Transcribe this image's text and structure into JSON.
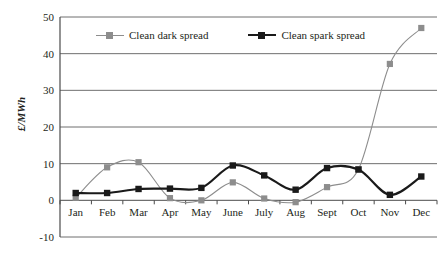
{
  "chart_data": {
    "type": "line",
    "title": "",
    "subtitle": "",
    "xlabel": "",
    "ylabel": "£/MWh",
    "categories": [
      "Jan",
      "Feb",
      "Mar",
      "Apr",
      "May",
      "June",
      "July",
      "Aug",
      "Sept",
      "Oct",
      "Nov",
      "Dec"
    ],
    "ylim": [
      -10,
      50
    ],
    "yticks": [
      50,
      40,
      30,
      20,
      10,
      0,
      -10
    ],
    "grid": true,
    "legend_position": "top-center",
    "series": [
      {
        "name": "Clean dark spread",
        "color": "#8d8d8d",
        "marker": "square",
        "values": [
          0.7,
          9.0,
          10.4,
          0.6,
          0.0,
          4.9,
          0.5,
          -0.5,
          3.6,
          8.5,
          37.2,
          47.0
        ]
      },
      {
        "name": "Clean spark spread",
        "color": "#1a1a1a",
        "marker": "square",
        "values": [
          2.0,
          2.0,
          3.1,
          3.2,
          3.4,
          9.5,
          6.8,
          2.9,
          8.8,
          8.4,
          1.5,
          6.5
        ]
      }
    ]
  },
  "legend": {
    "items": [
      {
        "label": "Clean dark spread"
      },
      {
        "label": "Clean spark spread"
      }
    ]
  },
  "axis": {
    "y_title": "£/MWh"
  }
}
